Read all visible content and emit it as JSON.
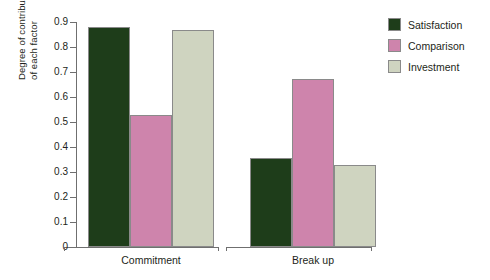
{
  "chart_data": {
    "type": "bar",
    "title": "",
    "subtitle": "",
    "xlabel": "",
    "ylabel": "Degree of contribution of each factor",
    "ylabel_lines": [
      "Degree of contribution",
      "of each factor"
    ],
    "categories": [
      "Commitment",
      "Break up"
    ],
    "series": [
      {
        "name": "Satisfaction",
        "color": "#1e3d1a",
        "values": [
          0.88,
          0.355
        ]
      },
      {
        "name": "Comparison",
        "color": "#ce84ac",
        "values": [
          0.528,
          0.673
        ]
      },
      {
        "name": "Investment",
        "color": "#cfd4c0",
        "values": [
          0.87,
          0.327
        ]
      }
    ],
    "ylim": [
      0,
      0.9
    ],
    "ytick_values": [
      0,
      0.1,
      0.2,
      0.3,
      0.4,
      0.5,
      0.6,
      0.7,
      0.8,
      0.9
    ],
    "ytick_labels": [
      "0",
      "0.1",
      "0.2",
      "0.3",
      "0.4",
      "0.5",
      "0.6",
      "0.7",
      "0.8",
      "0.9"
    ],
    "grid": false,
    "legend_position": "top-right",
    "bar_outline_color": "#8a8a8a",
    "axis_color": "#6f6f6f",
    "background": "#ffffff"
  }
}
